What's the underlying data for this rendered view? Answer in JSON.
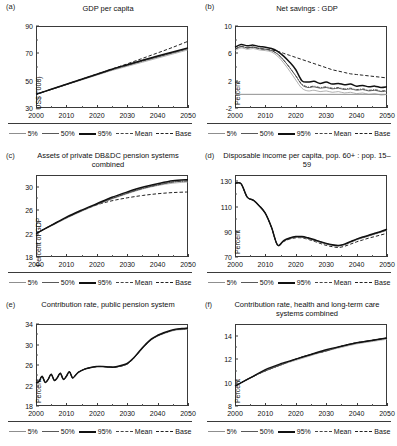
{
  "figure": {
    "panel_count": 6,
    "legend": {
      "items": [
        {
          "label": "5%",
          "style": "solid-thin-gray",
          "color": "#8f8f8f"
        },
        {
          "label": "50%",
          "style": "solid-medium",
          "color": "#595959"
        },
        {
          "label": "95%",
          "style": "solid-thick",
          "color": "#111111"
        },
        {
          "label": "Mean",
          "style": "dash-dot",
          "color": "#444444"
        },
        {
          "label": "Base",
          "style": "dashed",
          "color": "#222222"
        }
      ]
    }
  },
  "chart_data": [
    {
      "panel": "(a)",
      "type": "line",
      "title": "GDP per capita",
      "xlabel": "",
      "ylabel": "US$ ('000)",
      "xlim": [
        2000,
        2050
      ],
      "ylim": [
        30,
        90
      ],
      "xticks": [
        2000,
        2010,
        2020,
        2030,
        2040,
        2050
      ],
      "yticks": [
        30,
        50,
        70,
        90
      ],
      "grid": false,
      "x": [
        2000,
        2005,
        2010,
        2015,
        2020,
        2025,
        2030,
        2035,
        2040,
        2045,
        2050
      ],
      "series": [
        {
          "name": "5%",
          "values": [
            40.0,
            43.5,
            47.0,
            50.5,
            54.0,
            57.5,
            60.5,
            63.5,
            66.5,
            69.5,
            72.5
          ]
        },
        {
          "name": "50%",
          "values": [
            40.0,
            43.6,
            47.2,
            50.8,
            54.4,
            58.0,
            61.2,
            64.3,
            67.3,
            70.3,
            73.3
          ]
        },
        {
          "name": "95%",
          "values": [
            40.0,
            43.7,
            47.4,
            51.0,
            54.7,
            58.4,
            61.7,
            64.9,
            68.0,
            71.0,
            74.0
          ]
        },
        {
          "name": "Mean",
          "values": [
            40.0,
            43.6,
            47.2,
            50.9,
            54.5,
            58.1,
            61.3,
            64.4,
            67.5,
            70.5,
            73.5
          ]
        },
        {
          "name": "Base",
          "values": [
            40.0,
            43.7,
            47.4,
            51.1,
            54.8,
            58.5,
            62.3,
            66.3,
            70.3,
            74.4,
            78.8
          ]
        }
      ]
    },
    {
      "panel": "(b)",
      "type": "line",
      "title": "Net savings : GDP",
      "xlabel": "",
      "ylabel": "Percent",
      "xlim": [
        2000,
        2050
      ],
      "ylim": [
        -2,
        10
      ],
      "xticks": [
        2000,
        2010,
        2020,
        2030,
        2040,
        2050
      ],
      "yticks": [
        -2,
        2,
        6,
        10
      ],
      "grid": false,
      "zero_reference": 0,
      "x": [
        2000,
        2002,
        2004,
        2006,
        2008,
        2010,
        2012,
        2014,
        2016,
        2018,
        2020,
        2022,
        2024,
        2026,
        2028,
        2030,
        2032,
        2034,
        2036,
        2038,
        2040,
        2042,
        2044,
        2046,
        2048,
        2050
      ],
      "series": [
        {
          "name": "5%",
          "values": [
            6.4,
            6.8,
            6.6,
            6.7,
            6.5,
            6.4,
            6.2,
            5.6,
            4.6,
            3.4,
            2.1,
            0.9,
            0.5,
            0.6,
            0.4,
            0.5,
            0.3,
            0.4,
            0.2,
            0.3,
            0.1,
            0.2,
            0.0,
            0.1,
            -0.1,
            0.0
          ]
        },
        {
          "name": "50%",
          "values": [
            6.6,
            7.0,
            6.8,
            6.9,
            6.7,
            6.6,
            6.4,
            5.9,
            5.0,
            3.9,
            2.7,
            1.4,
            1.0,
            1.1,
            0.9,
            1.0,
            0.8,
            0.9,
            0.7,
            0.8,
            0.6,
            0.7,
            0.5,
            0.6,
            0.4,
            0.5
          ]
        },
        {
          "name": "95%",
          "values": [
            6.9,
            7.3,
            7.1,
            7.2,
            7.0,
            6.9,
            6.7,
            6.3,
            5.6,
            4.7,
            3.6,
            2.0,
            1.8,
            1.9,
            1.6,
            1.8,
            1.5,
            1.6,
            1.4,
            1.5,
            1.2,
            1.3,
            1.1,
            1.2,
            1.0,
            1.1
          ]
        },
        {
          "name": "Mean",
          "values": [
            6.6,
            7.0,
            6.8,
            6.9,
            6.7,
            6.6,
            6.4,
            5.9,
            5.0,
            3.9,
            2.7,
            1.5,
            1.1,
            1.2,
            1.0,
            1.1,
            0.9,
            1.0,
            0.8,
            0.9,
            0.7,
            0.8,
            0.6,
            0.7,
            0.5,
            0.6
          ]
        },
        {
          "name": "Base",
          "values": [
            6.6,
            7.0,
            6.8,
            6.9,
            6.7,
            6.6,
            6.5,
            6.3,
            6.0,
            5.7,
            5.4,
            5.1,
            4.8,
            4.5,
            4.2,
            3.9,
            3.6,
            3.4,
            3.2,
            3.0,
            2.9,
            2.8,
            2.7,
            2.6,
            2.5,
            2.4
          ]
        }
      ]
    },
    {
      "panel": "(c)",
      "type": "line",
      "title": "Assets of private DB&DC pension systems combined",
      "xlabel": "",
      "ylabel": "Percent of GDP",
      "xlim": [
        2000,
        2050
      ],
      "ylim": [
        18,
        32
      ],
      "xticks": [
        2000,
        2010,
        2020,
        2030,
        2040,
        2050
      ],
      "yticks": [
        18,
        22,
        26,
        30
      ],
      "grid": false,
      "x": [
        2000,
        2005,
        2010,
        2015,
        2020,
        2025,
        2030,
        2035,
        2040,
        2045,
        2050
      ],
      "series": [
        {
          "name": "5%",
          "values": [
            22.0,
            23.3,
            24.6,
            25.8,
            26.9,
            27.9,
            28.8,
            29.6,
            30.2,
            30.6,
            30.8
          ]
        },
        {
          "name": "50%",
          "values": [
            22.0,
            23.4,
            24.7,
            25.9,
            27.0,
            28.0,
            28.9,
            29.7,
            30.3,
            30.8,
            31.0
          ]
        },
        {
          "name": "95%",
          "values": [
            22.0,
            23.4,
            24.8,
            26.0,
            27.1,
            28.2,
            29.1,
            29.9,
            30.5,
            31.0,
            31.2
          ]
        },
        {
          "name": "Mean",
          "values": [
            22.0,
            23.4,
            24.7,
            25.9,
            27.0,
            28.0,
            28.9,
            29.7,
            30.3,
            30.8,
            31.0
          ]
        },
        {
          "name": "Base",
          "values": [
            22.0,
            23.4,
            24.7,
            25.9,
            26.9,
            27.6,
            28.1,
            28.5,
            28.8,
            29.0,
            29.1
          ]
        }
      ]
    },
    {
      "panel": "(d)",
      "type": "line",
      "title": "Disposable income per capita, pop. 60+ : pop. 15–59",
      "xlabel": "",
      "ylabel": "Percent",
      "xlim": [
        2000,
        2050
      ],
      "ylim": [
        70,
        135
      ],
      "xticks": [
        2000,
        2010,
        2020,
        2030,
        2040,
        2050
      ],
      "yticks": [
        70,
        90,
        110,
        130
      ],
      "grid": false,
      "x": [
        2000,
        2002,
        2004,
        2006,
        2008,
        2010,
        2012,
        2014,
        2016,
        2018,
        2020,
        2022,
        2024,
        2026,
        2028,
        2030,
        2032,
        2034,
        2036,
        2038,
        2040,
        2042,
        2044,
        2046,
        2048,
        2050
      ],
      "series": [
        {
          "name": "5%",
          "values": [
            128.5,
            128.0,
            117.5,
            115.0,
            110.5,
            104.5,
            93.5,
            79.5,
            82.5,
            84.5,
            85.5,
            85.5,
            84.5,
            83.0,
            81.5,
            80.0,
            79.0,
            78.5,
            79.5,
            81.5,
            83.5,
            85.0,
            86.5,
            88.0,
            89.5,
            91.0
          ]
        },
        {
          "name": "50%",
          "values": [
            128.5,
            128.0,
            117.5,
            115.0,
            110.5,
            104.5,
            93.5,
            79.5,
            82.8,
            84.8,
            86.0,
            86.0,
            85.0,
            83.5,
            82.0,
            80.5,
            79.5,
            79.0,
            80.0,
            82.0,
            84.0,
            85.5,
            87.0,
            88.5,
            90.0,
            91.5
          ]
        },
        {
          "name": "95%",
          "values": [
            128.5,
            128.0,
            117.5,
            115.0,
            110.5,
            104.5,
            93.5,
            79.5,
            83.0,
            85.0,
            86.2,
            86.2,
            85.2,
            83.8,
            82.2,
            80.8,
            79.8,
            79.2,
            80.2,
            82.2,
            84.2,
            85.8,
            87.2,
            88.8,
            90.2,
            92.0
          ]
        },
        {
          "name": "Mean",
          "values": [
            128.5,
            128.0,
            117.5,
            115.0,
            110.5,
            104.5,
            93.5,
            79.5,
            82.8,
            84.8,
            86.0,
            86.0,
            85.0,
            83.5,
            82.0,
            80.5,
            79.5,
            79.0,
            80.0,
            82.0,
            84.0,
            85.5,
            87.0,
            88.5,
            90.0,
            91.5
          ]
        },
        {
          "name": "Base",
          "values": [
            128.5,
            128.0,
            117.5,
            115.0,
            110.5,
            104.5,
            93.5,
            79.5,
            82.2,
            84.2,
            85.2,
            85.2,
            84.0,
            82.5,
            80.8,
            79.2,
            78.2,
            77.5,
            78.5,
            80.2,
            82.0,
            83.5,
            85.0,
            86.2,
            87.5,
            88.8
          ]
        }
      ]
    },
    {
      "panel": "(e)",
      "type": "line",
      "title": "Contribution rate, public pension system",
      "xlabel": "",
      "ylabel": "Percent",
      "xlim": [
        2000,
        2050
      ],
      "ylim": [
        18,
        34
      ],
      "xticks": [
        2000,
        2010,
        2020,
        2030,
        2040,
        2050
      ],
      "yticks": [
        18,
        22,
        26,
        30,
        34
      ],
      "grid": false,
      "x": [
        2000,
        2001,
        2002,
        2003,
        2004,
        2005,
        2006,
        2007,
        2008,
        2009,
        2010,
        2011,
        2012,
        2013,
        2014,
        2016,
        2018,
        2020,
        2022,
        2024,
        2026,
        2028,
        2030,
        2032,
        2034,
        2036,
        2038,
        2040,
        2042,
        2044,
        2046,
        2048,
        2050
      ],
      "series": [
        {
          "name": "5%",
          "values": [
            22.5,
            22.8,
            23.8,
            22.6,
            23.2,
            24.2,
            23.0,
            23.5,
            24.4,
            23.2,
            23.8,
            24.7,
            23.5,
            24.0,
            24.6,
            25.2,
            25.5,
            25.7,
            25.7,
            25.6,
            25.6,
            25.8,
            26.2,
            27.2,
            28.5,
            29.8,
            30.9,
            31.6,
            32.1,
            32.5,
            32.8,
            32.9,
            33.0
          ]
        },
        {
          "name": "50%",
          "values": [
            22.5,
            22.8,
            23.8,
            22.6,
            23.2,
            24.2,
            23.0,
            23.5,
            24.4,
            23.2,
            23.8,
            24.7,
            23.5,
            24.0,
            24.6,
            25.2,
            25.5,
            25.7,
            25.7,
            25.6,
            25.6,
            25.8,
            26.2,
            27.2,
            28.6,
            29.9,
            31.0,
            31.7,
            32.2,
            32.6,
            32.9,
            33.0,
            33.1
          ]
        },
        {
          "name": "95%",
          "values": [
            22.5,
            22.8,
            23.8,
            22.6,
            23.2,
            24.2,
            23.0,
            23.5,
            24.4,
            23.2,
            23.8,
            24.7,
            23.5,
            24.0,
            24.6,
            25.2,
            25.5,
            25.7,
            25.7,
            25.6,
            25.6,
            25.9,
            26.3,
            27.3,
            28.7,
            30.0,
            31.1,
            31.8,
            32.3,
            32.7,
            33.0,
            33.1,
            33.2
          ]
        },
        {
          "name": "Mean",
          "values": [
            22.5,
            22.8,
            23.8,
            22.6,
            23.2,
            24.2,
            23.0,
            23.5,
            24.4,
            23.2,
            23.8,
            24.7,
            23.5,
            24.0,
            24.6,
            25.2,
            25.5,
            25.7,
            25.7,
            25.6,
            25.6,
            25.8,
            26.2,
            27.2,
            28.6,
            29.9,
            31.0,
            31.7,
            32.2,
            32.6,
            32.9,
            33.0,
            33.1
          ]
        },
        {
          "name": "Base",
          "values": [
            22.5,
            22.8,
            23.8,
            22.6,
            23.2,
            24.2,
            23.0,
            23.5,
            24.4,
            23.2,
            23.8,
            24.7,
            23.5,
            24.0,
            24.6,
            25.2,
            25.5,
            25.7,
            25.7,
            25.6,
            25.6,
            25.8,
            26.2,
            27.2,
            28.6,
            29.9,
            31.0,
            31.7,
            32.2,
            32.6,
            32.9,
            33.0,
            33.1
          ]
        }
      ]
    },
    {
      "panel": "(f)",
      "type": "line",
      "title": "Contribution rate, health and long-term care systems combined",
      "xlabel": "",
      "ylabel": "Percent",
      "xlim": [
        2000,
        2050
      ],
      "ylim": [
        8,
        15
      ],
      "xticks": [
        2000,
        2010,
        2020,
        2030,
        2040,
        2050
      ],
      "yticks": [
        8,
        10,
        12,
        14
      ],
      "grid": false,
      "x": [
        2000,
        2005,
        2010,
        2015,
        2020,
        2025,
        2030,
        2035,
        2040,
        2045,
        2050
      ],
      "series": [
        {
          "name": "5%",
          "values": [
            9.7,
            10.4,
            11.0,
            11.5,
            11.9,
            12.3,
            12.7,
            13.0,
            13.3,
            13.5,
            13.7
          ]
        },
        {
          "name": "50%",
          "values": [
            9.7,
            10.4,
            11.0,
            11.5,
            12.0,
            12.4,
            12.7,
            13.1,
            13.4,
            13.6,
            13.8
          ]
        },
        {
          "name": "95%",
          "values": [
            9.7,
            10.4,
            11.1,
            11.6,
            12.0,
            12.4,
            12.8,
            13.1,
            13.4,
            13.6,
            13.8
          ]
        },
        {
          "name": "Mean",
          "values": [
            9.7,
            10.4,
            11.0,
            11.5,
            12.0,
            12.4,
            12.7,
            13.1,
            13.4,
            13.6,
            13.8
          ]
        },
        {
          "name": "Base",
          "values": [
            9.7,
            10.4,
            11.0,
            11.5,
            12.0,
            12.4,
            12.7,
            13.1,
            13.4,
            13.6,
            13.8
          ]
        }
      ]
    }
  ]
}
